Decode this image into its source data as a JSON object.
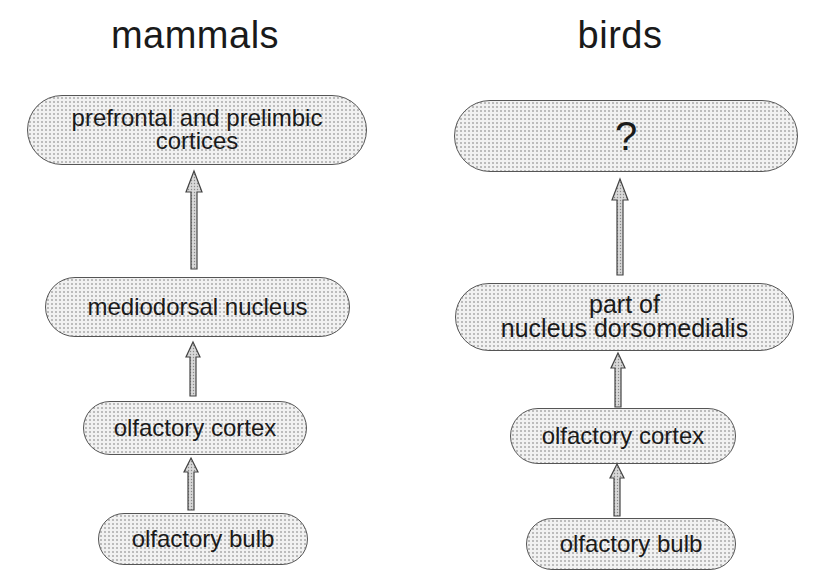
{
  "columns": [
    {
      "title": "mammals",
      "nodes": [
        {
          "lines": [
            "prefrontal and prelimbic",
            "cortices"
          ]
        },
        {
          "lines": [
            "mediodorsal nucleus"
          ]
        },
        {
          "lines": [
            "olfactory cortex"
          ]
        },
        {
          "lines": [
            "olfactory bulb"
          ]
        }
      ]
    },
    {
      "title": "birds",
      "nodes": [
        {
          "lines": [
            "?"
          ]
        },
        {
          "lines": [
            "part of",
            "nucleus dorsomedialis"
          ]
        },
        {
          "lines": [
            "olfactory cortex"
          ]
        },
        {
          "lines": [
            "olfactory bulb"
          ]
        }
      ]
    }
  ],
  "edges": [
    {
      "column": "mammals",
      "from": "olfactory bulb",
      "to": "olfactory cortex"
    },
    {
      "column": "mammals",
      "from": "olfactory cortex",
      "to": "mediodorsal nucleus"
    },
    {
      "column": "mammals",
      "from": "mediodorsal nucleus",
      "to": "prefrontal and prelimbic cortices"
    },
    {
      "column": "birds",
      "from": "olfactory bulb",
      "to": "olfactory cortex"
    },
    {
      "column": "birds",
      "from": "olfactory cortex",
      "to": "part of nucleus dorsomedialis"
    },
    {
      "column": "birds",
      "from": "part of nucleus dorsomedialis",
      "to": "?"
    }
  ]
}
